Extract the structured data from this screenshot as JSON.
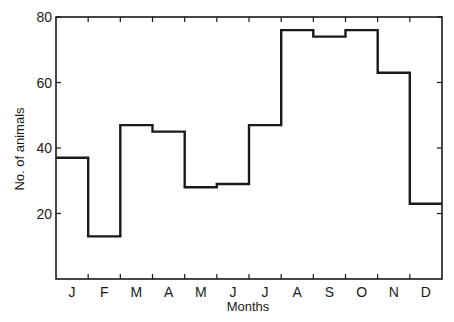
{
  "chart_data": {
    "type": "bar",
    "style": "step-histogram",
    "title": "",
    "xlabel": "Months",
    "ylabel": "No. of animals",
    "categories": [
      "J",
      "F",
      "M",
      "A",
      "M",
      "J",
      "J",
      "A",
      "S",
      "O",
      "N",
      "D"
    ],
    "values": [
      37,
      13,
      47,
      45,
      28,
      29,
      47,
      76,
      74,
      76,
      63,
      23
    ],
    "ylim": [
      0,
      80
    ],
    "yticks": [
      20,
      40,
      60,
      80
    ],
    "grid": false,
    "legend": null
  },
  "colors": {
    "line": "#1a1a1a",
    "background": "#ffffff"
  }
}
